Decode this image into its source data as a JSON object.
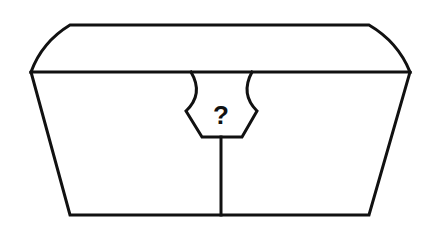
{
  "diagram": {
    "lock_label": "?",
    "stroke_color": "#111111",
    "background_color": "#ffffff"
  }
}
